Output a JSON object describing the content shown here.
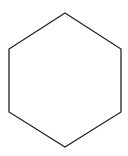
{
  "diagram": {
    "shape": "hexagon",
    "orientation": "pointy-top",
    "stroke_color": "#222222",
    "fill_color": "#ffffff",
    "stroke_width": 1.3,
    "points": "65,13 121,49 121,112 65,147 9,112 9,49"
  }
}
